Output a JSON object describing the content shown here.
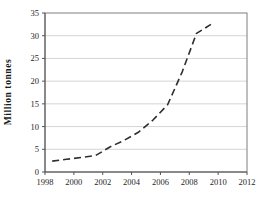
{
  "chart_data": {
    "type": "line",
    "title": "",
    "xlabel": "",
    "ylabel": "Million tonnes",
    "x": [
      1999,
      2000,
      2001,
      2002,
      2003,
      2004,
      2005,
      2006,
      2007,
      2008,
      2009,
      2010
    ],
    "series": [
      {
        "name": "million-tonnes",
        "values": [
          2.4,
          2.8,
          3.2,
          3.6,
          5.5,
          7.0,
          8.8,
          11.5,
          14.8,
          22.0,
          30.5,
          32.5
        ],
        "line_style": "dashed",
        "color": "#2e2e2e"
      }
    ],
    "xlim": [
      1998,
      2012
    ],
    "ylim": [
      0,
      35
    ],
    "xticks": [
      1998,
      2000,
      2002,
      2004,
      2006,
      2008,
      2010,
      2012
    ],
    "yticks": [
      0,
      5,
      10,
      15,
      20,
      25,
      30,
      35
    ],
    "grid": "horizontal",
    "legend": "none",
    "frame": true,
    "colors": {
      "gridline": "#c9c9c9",
      "frame": "#7f7f7f",
      "axis": "#555555",
      "background": "#ffffff"
    }
  }
}
